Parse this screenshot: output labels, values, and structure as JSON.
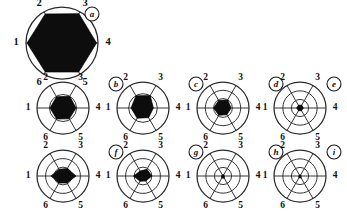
{
  "figure": {
    "width": 347,
    "height": 217,
    "background": "#ffffff",
    "ink": "#111111",
    "fill_color": "#0d0d0d",
    "ring_color": "#2b2b2b"
  },
  "axes": {
    "labels": [
      "1",
      "2",
      "3",
      "4",
      "5",
      "6"
    ],
    "count": 6,
    "note": "axis 1 at left (180deg), numbering clockwise: 2 upper-left, 3 upper-right, 4 right, 5 lower-right, 6 lower-left"
  },
  "chart_data": {
    "type": "radar",
    "title": "",
    "xlabel": "",
    "ylabel": "",
    "grid": true,
    "legend_position": "none",
    "categories": [
      "1",
      "2",
      "3",
      "4",
      "5",
      "6"
    ],
    "rmax": 1.0,
    "rlim": [
      0,
      1
    ],
    "panels": [
      {
        "id": "a",
        "label": "a",
        "rings": 1,
        "ring_radii": [
          1.0
        ],
        "values": [
          0.97,
          0.93,
          0.94,
          0.96,
          0.93,
          0.93
        ],
        "cx": 62,
        "cy": 43,
        "r": 36,
        "label_offset": 10,
        "badge": {
          "cx": 92,
          "cy": 14,
          "r": 7
        }
      },
      {
        "id": "b",
        "label": "b",
        "rings": 2,
        "ring_radii": [
          0.52,
          1.0
        ],
        "values": [
          0.5,
          0.5,
          0.52,
          0.5,
          0.48,
          0.49
        ],
        "cx": 63,
        "cy": 108,
        "r": 26,
        "label_offset": 9,
        "badge": {
          "cx": 116,
          "cy": 84,
          "r": 7
        }
      },
      {
        "id": "c",
        "label": "c",
        "rings": 2,
        "ring_radii": [
          0.55,
          1.0
        ],
        "values": [
          0.46,
          0.54,
          0.55,
          0.4,
          0.43,
          0.45
        ],
        "cx": 143,
        "cy": 108,
        "r": 26,
        "label_offset": 9,
        "badge": {
          "cx": 196,
          "cy": 84,
          "r": 7
        }
      },
      {
        "id": "d",
        "label": "d",
        "rings": 3,
        "ring_radii": [
          0.36,
          0.68,
          1.0
        ],
        "values": [
          0.36,
          0.33,
          0.36,
          0.31,
          0.3,
          0.32
        ],
        "cx": 223,
        "cy": 108,
        "r": 26,
        "label_offset": 9,
        "badge": {
          "cx": 276,
          "cy": 84,
          "r": 7
        }
      },
      {
        "id": "e",
        "label": "e",
        "rings": 3,
        "ring_radii": [
          0.33,
          0.66,
          1.0
        ],
        "values": [
          0.13,
          0.12,
          0.13,
          0.13,
          0.12,
          0.12
        ],
        "cx": 300,
        "cy": 108,
        "r": 26,
        "label_offset": 9,
        "badge": {
          "cx": 334,
          "cy": 84,
          "r": 7
        }
      },
      {
        "id": "f",
        "label": "f",
        "rings": 3,
        "ring_radii": [
          0.34,
          0.67,
          1.0
        ],
        "values": [
          0.46,
          0.3,
          0.33,
          0.5,
          0.31,
          0.31
        ],
        "cx": 63,
        "cy": 176,
        "r": 26,
        "label_offset": 9,
        "badge": {
          "cx": 116,
          "cy": 152,
          "r": 7
        }
      },
      {
        "id": "g",
        "label": "g",
        "rings": 3,
        "ring_radii": [
          0.34,
          0.67,
          1.0
        ],
        "values": [
          0.36,
          0.22,
          0.3,
          0.34,
          0.22,
          0.23
        ],
        "cx": 143,
        "cy": 176,
        "r": 26,
        "label_offset": 9,
        "badge": {
          "cx": 196,
          "cy": 152,
          "r": 7
        }
      },
      {
        "id": "h",
        "label": "h",
        "rings": 3,
        "ring_radii": [
          0.33,
          0.66,
          1.0
        ],
        "values": [
          0.06,
          0.05,
          0.06,
          0.05,
          0.1,
          0.09
        ],
        "cx": 223,
        "cy": 176,
        "r": 26,
        "label_offset": 9,
        "badge": {
          "cx": 276,
          "cy": 152,
          "r": 7
        }
      },
      {
        "id": "i",
        "label": "i",
        "rings": 3,
        "ring_radii": [
          0.33,
          0.66,
          1.0
        ],
        "values": [
          0.05,
          0.04,
          0.05,
          0.04,
          0.09,
          0.08
        ],
        "cx": 300,
        "cy": 176,
        "r": 26,
        "label_offset": 9,
        "badge": {
          "cx": 334,
          "cy": 152,
          "r": 7
        }
      }
    ]
  }
}
